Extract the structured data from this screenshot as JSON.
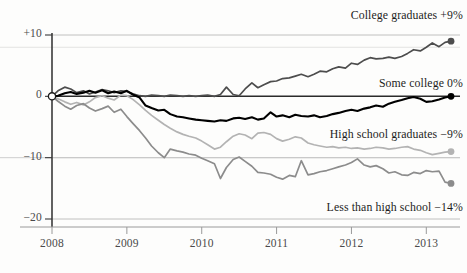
{
  "chart_data": {
    "type": "line",
    "title": "",
    "subtitle": "",
    "xlabel": "",
    "ylabel": "",
    "xlim": [
      2008.0,
      2013.45
    ],
    "ylim": [
      -20,
      10
    ],
    "grid": true,
    "grid_axis": "y",
    "legend_position": "inline-right",
    "y_ticks": [
      {
        "value": 10,
        "label": "+10"
      },
      {
        "value": 0,
        "label": "0"
      },
      {
        "value": -10,
        "label": "-10"
      },
      {
        "value": -20,
        "label": "-20"
      }
    ],
    "x_ticks": [
      {
        "value": 2008,
        "label": "2008"
      },
      {
        "value": 2009,
        "label": "2009"
      },
      {
        "value": 2010,
        "label": "2010"
      },
      {
        "value": 2011,
        "label": "2011"
      },
      {
        "value": 2012,
        "label": "2012"
      },
      {
        "value": 2013,
        "label": "2013"
      }
    ],
    "series": [
      {
        "name": "College graduates",
        "label": "College graduates +9%",
        "end_value": 9,
        "end_value_text": "+9%",
        "color": "#4d4d4d",
        "width": 1.7,
        "marker_end": true,
        "x": [
          2008.0,
          2008.08,
          2008.17,
          2008.25,
          2008.33,
          2008.42,
          2008.5,
          2008.58,
          2008.67,
          2008.75,
          2008.83,
          2008.92,
          2009.0,
          2009.08,
          2009.17,
          2009.25,
          2009.33,
          2009.42,
          2009.5,
          2009.58,
          2009.67,
          2009.75,
          2009.83,
          2009.92,
          2010.0,
          2010.08,
          2010.17,
          2010.25,
          2010.33,
          2010.42,
          2010.5,
          2010.58,
          2010.67,
          2010.75,
          2010.83,
          2010.92,
          2011.0,
          2011.08,
          2011.17,
          2011.25,
          2011.33,
          2011.42,
          2011.5,
          2011.58,
          2011.67,
          2011.75,
          2011.83,
          2011.92,
          2012.0,
          2012.08,
          2012.17,
          2012.25,
          2012.33,
          2012.42,
          2012.5,
          2012.58,
          2012.67,
          2012.75,
          2012.83,
          2012.92,
          2013.0,
          2013.08,
          2013.17,
          2013.25,
          2013.33
        ],
        "y": [
          0,
          0.9,
          1.5,
          1.2,
          0.6,
          0.9,
          0.4,
          0.7,
          1.1,
          0.9,
          0.6,
          0.9,
          0.8,
          0.4,
          0.1,
          0.0,
          0.2,
          0.1,
          0.0,
          0.2,
          0.1,
          0.0,
          0.1,
          0.0,
          0.1,
          0.2,
          0.0,
          0.3,
          1.5,
          0.3,
          0.1,
          1.2,
          2.2,
          1.4,
          1.9,
          2.4,
          2.5,
          2.9,
          3.0,
          3.3,
          3.6,
          3.2,
          3.6,
          4.1,
          4.0,
          4.5,
          4.8,
          4.6,
          5.4,
          5.2,
          5.9,
          6.3,
          6.1,
          6.2,
          6.4,
          6.2,
          6.5,
          7.0,
          7.6,
          7.4,
          8.0,
          8.7,
          8.1,
          8.8,
          9.0
        ]
      },
      {
        "name": "Some college",
        "label": "Some college 0%",
        "end_value": 0,
        "end_value_text": "0%",
        "color": "#000000",
        "width": 2.1,
        "marker_end": true,
        "x": [
          2008.0,
          2008.08,
          2008.17,
          2008.25,
          2008.33,
          2008.42,
          2008.5,
          2008.58,
          2008.67,
          2008.75,
          2008.83,
          2008.92,
          2009.0,
          2009.08,
          2009.17,
          2009.25,
          2009.33,
          2009.42,
          2009.5,
          2009.58,
          2009.67,
          2009.75,
          2009.83,
          2009.92,
          2010.0,
          2010.08,
          2010.17,
          2010.25,
          2010.33,
          2010.42,
          2010.5,
          2010.58,
          2010.67,
          2010.75,
          2010.83,
          2010.92,
          2011.0,
          2011.08,
          2011.17,
          2011.25,
          2011.33,
          2011.42,
          2011.5,
          2011.58,
          2011.67,
          2011.75,
          2011.83,
          2011.92,
          2012.0,
          2012.08,
          2012.17,
          2012.25,
          2012.33,
          2012.42,
          2012.5,
          2012.58,
          2012.67,
          2012.75,
          2012.83,
          2012.92,
          2013.0,
          2013.08,
          2013.17,
          2013.25,
          2013.33
        ],
        "y": [
          0,
          0.1,
          0.5,
          0.7,
          0.4,
          0.6,
          0.9,
          0.6,
          1.0,
          0.5,
          0.8,
          0.5,
          0.9,
          0.3,
          -0.2,
          -1.5,
          -1.9,
          -2.3,
          -2.2,
          -2.9,
          -3.3,
          -3.4,
          -3.6,
          -3.8,
          -3.9,
          -4.0,
          -4.1,
          -3.9,
          -4.0,
          -3.6,
          -3.5,
          -3.7,
          -3.4,
          -3.8,
          -3.6,
          -2.6,
          -3.3,
          -3.1,
          -3.4,
          -3.0,
          -3.2,
          -3.3,
          -3.1,
          -3.4,
          -3.2,
          -2.9,
          -2.7,
          -2.4,
          -2.2,
          -2.4,
          -2.0,
          -1.8,
          -1.5,
          -1.7,
          -1.2,
          -0.9,
          -0.6,
          -0.3,
          -0.1,
          -0.4,
          -0.9,
          -0.8,
          -0.5,
          -0.2,
          0.0
        ]
      },
      {
        "name": "High school graduates",
        "label": "High school graduates -9%",
        "end_value": -9,
        "end_value_text": "-9%",
        "color": "#b3b3b3",
        "width": 1.7,
        "marker_end": true,
        "x": [
          2008.0,
          2008.08,
          2008.17,
          2008.25,
          2008.33,
          2008.42,
          2008.5,
          2008.58,
          2008.67,
          2008.75,
          2008.83,
          2008.92,
          2009.0,
          2009.08,
          2009.17,
          2009.25,
          2009.33,
          2009.42,
          2009.5,
          2009.58,
          2009.67,
          2009.75,
          2009.83,
          2009.92,
          2010.0,
          2010.08,
          2010.17,
          2010.25,
          2010.33,
          2010.42,
          2010.5,
          2010.58,
          2010.67,
          2010.75,
          2010.83,
          2010.92,
          2011.0,
          2011.08,
          2011.17,
          2011.25,
          2011.33,
          2011.42,
          2011.5,
          2011.58,
          2011.67,
          2011.75,
          2011.83,
          2011.92,
          2012.0,
          2012.08,
          2012.17,
          2012.25,
          2012.33,
          2012.42,
          2012.5,
          2012.58,
          2012.67,
          2012.75,
          2012.83,
          2012.92,
          2013.0,
          2013.08,
          2013.17,
          2013.25,
          2013.33
        ],
        "y": [
          0,
          -0.4,
          -0.9,
          -1.3,
          -1.0,
          -1.4,
          -0.9,
          -0.2,
          0.1,
          -0.3,
          -0.6,
          0.2,
          0.1,
          -0.5,
          -1.4,
          -2.3,
          -3.1,
          -3.9,
          -4.6,
          -5.2,
          -5.8,
          -6.2,
          -6.5,
          -6.8,
          -7.3,
          -7.9,
          -8.6,
          -8.3,
          -7.4,
          -6.5,
          -6.1,
          -6.3,
          -6.9,
          -6.0,
          -5.9,
          -6.2,
          -6.9,
          -7.3,
          -7.0,
          -6.6,
          -6.8,
          -7.6,
          -7.9,
          -8.1,
          -8.3,
          -8.2,
          -8.4,
          -8.3,
          -8.5,
          -8.4,
          -8.6,
          -8.5,
          -8.3,
          -8.4,
          -8.6,
          -8.5,
          -8.3,
          -8.2,
          -8.6,
          -8.8,
          -9.2,
          -9.5,
          -9.3,
          -9.1,
          -9.0
        ]
      },
      {
        "name": "Less than high school",
        "label": "Less than high school -14%",
        "end_value": -14,
        "end_value_text": "-14%",
        "color": "#8c8c8c",
        "width": 1.7,
        "marker_end": true,
        "x": [
          2008.0,
          2008.08,
          2008.17,
          2008.25,
          2008.33,
          2008.42,
          2008.5,
          2008.58,
          2008.67,
          2008.75,
          2008.83,
          2008.92,
          2009.0,
          2009.08,
          2009.17,
          2009.25,
          2009.33,
          2009.42,
          2009.5,
          2009.58,
          2009.67,
          2009.75,
          2009.83,
          2009.92,
          2010.0,
          2010.08,
          2010.17,
          2010.25,
          2010.33,
          2010.42,
          2010.5,
          2010.58,
          2010.67,
          2010.75,
          2010.83,
          2010.92,
          2011.0,
          2011.08,
          2011.17,
          2011.25,
          2011.33,
          2011.42,
          2011.5,
          2011.58,
          2011.67,
          2011.75,
          2011.83,
          2011.92,
          2012.0,
          2012.08,
          2012.17,
          2012.25,
          2012.33,
          2012.42,
          2012.5,
          2012.58,
          2012.67,
          2012.75,
          2012.83,
          2012.92,
          2013.0,
          2013.08,
          2013.17,
          2013.25,
          2013.33
        ],
        "y": [
          0,
          -0.8,
          -1.6,
          -2.1,
          -1.5,
          -1.2,
          -1.9,
          -2.4,
          -2.0,
          -1.6,
          -2.6,
          -2.1,
          -3.3,
          -4.4,
          -5.6,
          -6.8,
          -8.1,
          -9.2,
          -10.0,
          -8.6,
          -8.9,
          -9.1,
          -9.4,
          -9.6,
          -10.1,
          -10.5,
          -11.0,
          -13.4,
          -11.6,
          -10.3,
          -9.9,
          -10.6,
          -11.4,
          -12.4,
          -12.5,
          -12.7,
          -13.2,
          -13.5,
          -12.9,
          -13.1,
          -10.5,
          -12.8,
          -12.6,
          -12.3,
          -12.1,
          -11.8,
          -11.5,
          -11.2,
          -10.8,
          -10.2,
          -11.2,
          -11.5,
          -11.3,
          -11.8,
          -12.5,
          -12.3,
          -12.8,
          -12.9,
          -12.4,
          -12.6,
          -12.1,
          -12.3,
          -12.2,
          -14.0,
          -14.2
        ]
      }
    ]
  },
  "axis": {
    "y_axis_name": "percent-change-axis",
    "x_axis_name": "year-axis"
  }
}
